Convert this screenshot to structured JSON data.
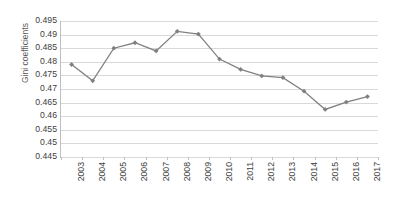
{
  "chart_data": {
    "type": "line",
    "title": "",
    "xlabel": "",
    "ylabel": "Gini coefficients",
    "categories": [
      "2003",
      "2004",
      "2005",
      "2006",
      "2007",
      "2008",
      "2009",
      "2010",
      "2011",
      "2012",
      "2013",
      "2014",
      "2015",
      "2016",
      "2017"
    ],
    "values": [
      0.479,
      0.473,
      0.485,
      0.487,
      0.484,
      0.4912,
      0.4902,
      0.481,
      0.4772,
      0.4748,
      0.4742,
      0.4692,
      0.4625,
      0.4652,
      0.4672
    ],
    "series": [
      {
        "name": "Gini coefficients",
        "values": [
          0.479,
          0.473,
          0.485,
          0.487,
          0.484,
          0.4912,
          0.4902,
          0.481,
          0.4772,
          0.4748,
          0.4742,
          0.4692,
          0.4625,
          0.4652,
          0.4672
        ]
      }
    ],
    "ylim": [
      0.445,
      0.495
    ],
    "ytick_labels": [
      "0.495",
      "0.49",
      "0.485",
      "0.48",
      "0.475",
      "0.47",
      "0.465",
      "0.46",
      "0.455",
      "0.45",
      "0.445"
    ],
    "ytick_values": [
      0.495,
      0.49,
      0.485,
      0.48,
      0.475,
      0.47,
      0.465,
      0.46,
      0.455,
      0.45,
      0.445
    ],
    "ytick_step": 0.005,
    "grid": true,
    "grid_color": "#d9d9d9",
    "legend": false,
    "legend_position": "none",
    "line_color": "#808080",
    "marker": "diamond",
    "marker_color": "#808080",
    "axis_color": "#bfbfbf",
    "background": "#ffffff",
    "text_color": "#404040"
  }
}
